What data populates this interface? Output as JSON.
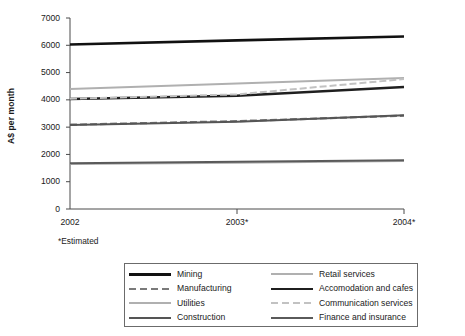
{
  "chart_data": {
    "type": "line",
    "title": "",
    "subtitle": "",
    "xlabel": "",
    "ylabel": "A$ per month",
    "categories": [
      "2002",
      "2003*",
      "2004*"
    ],
    "x": [
      2002,
      2003,
      2004
    ],
    "ylim": [
      0,
      7000
    ],
    "yticks": [
      0,
      1000,
      2000,
      3000,
      4000,
      5000,
      6000,
      7000
    ],
    "ytick_labels": [
      "0",
      "1000",
      "2000",
      "3000",
      "4000",
      "5000",
      "6000",
      "7000"
    ],
    "grid": false,
    "legend_position": "bottom",
    "footnote": "*Estimated",
    "series": [
      {
        "name": "Mining",
        "values": [
          6030,
          6180,
          6320
        ],
        "color": "#111111",
        "style": "solid",
        "width": 2.6,
        "legend_column": 0,
        "legend_row": 0
      },
      {
        "name": "Manufacturing",
        "values": [
          3090,
          3220,
          3420
        ],
        "color": "#7a7a7a",
        "style": "dashed",
        "width": 2.2,
        "legend_column": 0,
        "legend_row": 1
      },
      {
        "name": "Utilities",
        "values": [
          4400,
          4600,
          4800
        ],
        "color": "#b0b0b0",
        "style": "solid",
        "width": 2.1,
        "legend_column": 0,
        "legend_row": 2
      },
      {
        "name": "Construction",
        "values": [
          3080,
          3200,
          3440
        ],
        "color": "#555555",
        "style": "solid",
        "width": 2.0,
        "legend_column": 0,
        "legend_row": 3
      },
      {
        "name": "Retail services",
        "values": [
          1650,
          1700,
          1760
        ],
        "color": "#b0b0b0",
        "style": "solid",
        "width": 2.1,
        "legend_column": 1,
        "legend_row": 0
      },
      {
        "name": "Accomodation and cafes",
        "values": [
          4030,
          4150,
          4470
        ],
        "color": "#1f1f1f",
        "style": "solid",
        "width": 2.4,
        "legend_column": 1,
        "legend_row": 1
      },
      {
        "name": "Communication services",
        "values": [
          4040,
          4200,
          4760
        ],
        "color": "#c2c2c2",
        "style": "dashed",
        "width": 2.0,
        "legend_column": 1,
        "legend_row": 2
      },
      {
        "name": "Finance and insurance",
        "values": [
          1680,
          1730,
          1790
        ],
        "color": "#5a5a5a",
        "style": "solid",
        "width": 2.0,
        "legend_column": 1,
        "legend_row": 3
      }
    ],
    "axis_color": "#4a4a4a",
    "plot_left_px": 70,
    "plot_right_px": 404,
    "plot_top_px": 18,
    "plot_bottom_px": 209
  }
}
